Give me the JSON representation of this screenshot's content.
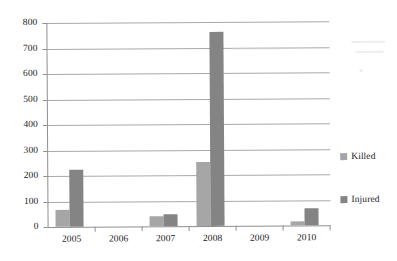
{
  "chart_data": {
    "type": "bar",
    "title": "",
    "subtitle": "",
    "xlabel": "",
    "ylabel": "",
    "categories": [
      "2005",
      "2006",
      "2007",
      "2008",
      "2009",
      "2010"
    ],
    "series": [
      {
        "name": "Killed",
        "color": "#a6a6a6",
        "values": [
          65,
          0,
          40,
          250,
          0,
          15
        ]
      },
      {
        "name": "Injured",
        "color": "#848484",
        "values": [
          225,
          0,
          48,
          760,
          0,
          65
        ]
      }
    ],
    "ylim": [
      0,
      800
    ],
    "yticks": [
      0,
      100,
      200,
      300,
      400,
      500,
      600,
      700,
      800
    ],
    "ytick_labels": [
      "0",
      "100",
      "200",
      "300",
      "400",
      "500",
      "600",
      "700",
      "800"
    ],
    "grid": true,
    "grid_axis": "y",
    "legend_position": "right",
    "legend_entries": [
      "Killed",
      "Injured"
    ]
  },
  "axes": {
    "y_labels": [
      "800",
      "700",
      "600",
      "500",
      "400",
      "300",
      "200",
      "100",
      "0"
    ],
    "x_labels": [
      "2005",
      "2006",
      "2007",
      "2008",
      "2009",
      "2010"
    ]
  },
  "legend": {
    "items": [
      {
        "label": "Killed",
        "swatch": "killed-swatch-icon"
      },
      {
        "label": "Injured",
        "swatch": "injured-swatch-icon"
      }
    ]
  }
}
